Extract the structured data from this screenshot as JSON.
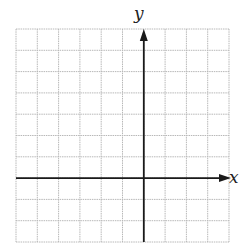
{
  "grid": {
    "left": 16,
    "top": 29,
    "cell": 21.3,
    "cols": 10,
    "rows": 10,
    "origin_col": 6,
    "origin_row": 7,
    "grid_color": "#b8b8b8",
    "axis_color": "#1a1a1a"
  },
  "axes": {
    "x_label": "x",
    "y_label": "y"
  }
}
